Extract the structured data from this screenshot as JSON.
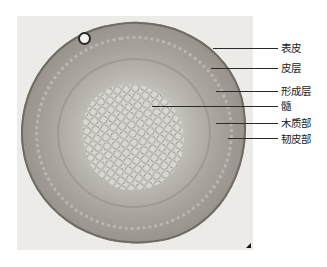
{
  "figure": {
    "labels": [
      {
        "id": "epidermis",
        "text": "表皮",
        "y": 48,
        "line_start_x": 213
      },
      {
        "id": "cortex",
        "text": "皮层",
        "y": 68,
        "line_start_x": 211
      },
      {
        "id": "cambium",
        "text": "形成层",
        "y": 91,
        "line_start_x": 216
      },
      {
        "id": "pith",
        "text": "髓",
        "y": 106,
        "line_start_x": 152
      },
      {
        "id": "xylem",
        "text": "木质部",
        "y": 123,
        "line_start_x": 216
      },
      {
        "id": "phloem",
        "text": "韧皮部",
        "y": 138,
        "line_start_x": 228
      }
    ],
    "line_end_x": 278,
    "colors": {
      "line": "#2b2b2b",
      "text": "#222222",
      "background": "#ffffff"
    }
  }
}
